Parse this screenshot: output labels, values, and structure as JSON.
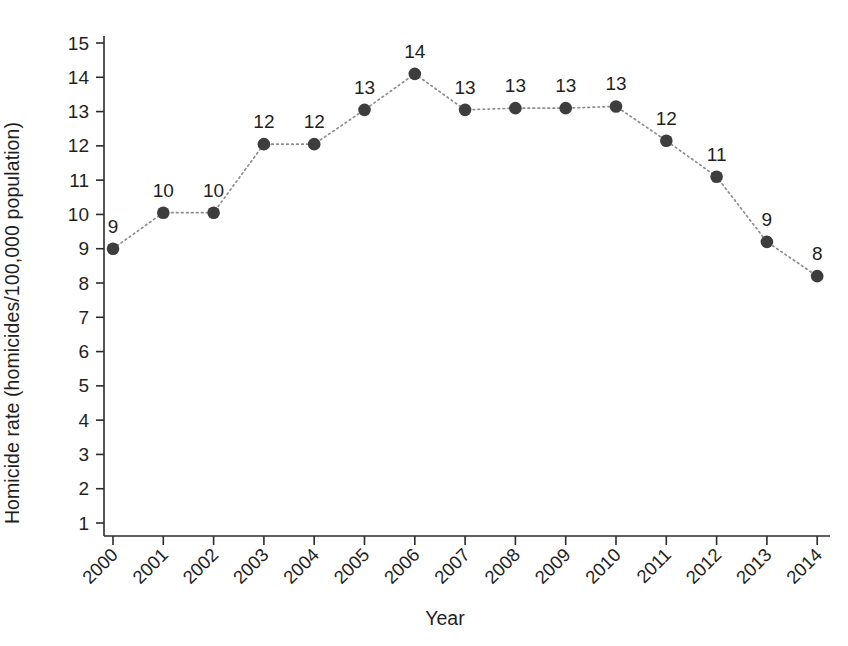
{
  "chart_data": {
    "type": "line",
    "title": "",
    "subtitle": "",
    "xlabel": "Year",
    "ylabel": "Homicide rate (homicides/100,000 population)",
    "categories": [
      "2000",
      "2001",
      "2002",
      "2003",
      "2004",
      "2005",
      "2006",
      "2007",
      "2008",
      "2009",
      "2010",
      "2011",
      "2012",
      "2013",
      "2014"
    ],
    "values": [
      9.0,
      10.05,
      10.05,
      12.05,
      12.05,
      13.05,
      14.1,
      13.05,
      13.1,
      13.1,
      13.15,
      12.15,
      11.1,
      9.2,
      8.2
    ],
    "point_labels": [
      "9",
      "10",
      "10",
      "12",
      "12",
      "13",
      "14",
      "13",
      "13",
      "13",
      "13",
      "12",
      "11",
      "9",
      "8"
    ],
    "ylim": [
      0.6,
      15.4
    ],
    "yticks": [
      1,
      2,
      3,
      4,
      5,
      6,
      7,
      8,
      9,
      10,
      11,
      12,
      13,
      14,
      15
    ],
    "ytick_labels": [
      "1",
      "2",
      "3",
      "4",
      "5",
      "6",
      "7",
      "8",
      "9",
      "10",
      "11",
      "12",
      "13",
      "14",
      "15"
    ],
    "xticks": [
      "2000",
      "2001",
      "2002",
      "2003",
      "2004",
      "2005",
      "2006",
      "2007",
      "2008",
      "2009",
      "2010",
      "2011",
      "2012",
      "2013",
      "2014"
    ],
    "grid": false,
    "legend": false,
    "legend_position": "none",
    "xtick_rotation_deg": -45,
    "marker": "filled-circle",
    "marker_color": "#3d3d3d",
    "line_style": "dotted",
    "line_color": "#8d8d8d",
    "axis_color": "#2b2b2b",
    "background_color": "#ffffff",
    "text_color": "#1f1f1f"
  }
}
